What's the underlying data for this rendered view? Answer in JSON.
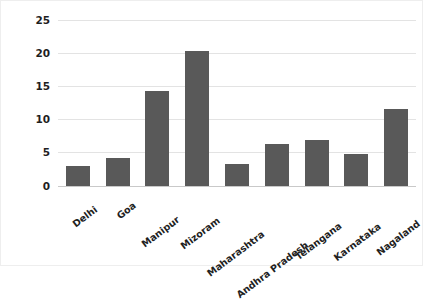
{
  "chart_data": {
    "type": "bar",
    "title": "",
    "xlabel": "",
    "ylabel": "New cases per 10000",
    "categories": [
      "Delhi",
      "Goa",
      "Manipur",
      "Mizoram",
      "Maharashtra",
      "Andhra Pradesh",
      "Telangana",
      "Karnataka",
      "Nagaland"
    ],
    "values": [
      2.9,
      4.1,
      14.3,
      20.3,
      3.2,
      6.3,
      6.9,
      4.7,
      11.5
    ],
    "ylim": [
      0,
      25
    ],
    "ytick_labels": [
      "0",
      "5",
      "10",
      "15",
      "20",
      "25"
    ],
    "ytick_values": [
      0,
      5,
      10,
      15,
      20,
      25
    ],
    "grid": true,
    "legend": "none",
    "bar_color": "#595959",
    "gridline_color": "#e3e3e3",
    "background_color": "#ffffff",
    "text_color": "#1f1f1f"
  }
}
